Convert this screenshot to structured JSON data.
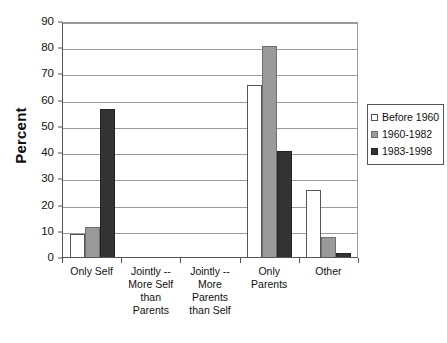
{
  "chart_data": {
    "type": "bar",
    "title": "",
    "xlabel": "",
    "ylabel": "Percent",
    "ylim": [
      0,
      90
    ],
    "ytick_step": 10,
    "yticks": [
      90,
      80,
      70,
      60,
      50,
      40,
      30,
      20,
      10,
      0
    ],
    "grid": true,
    "legend_position": "right",
    "categories": [
      "Only Self",
      "Jointly -- More Self than Parents",
      "Jointly -- More Parents than Self",
      "Only Parents",
      "Other"
    ],
    "category_label_lines": [
      [
        "Only Self"
      ],
      [
        "Jointly --",
        "More Self",
        "than",
        "Parents"
      ],
      [
        "Jointly --",
        "More",
        "Parents",
        "than Self"
      ],
      [
        "Only",
        "Parents"
      ],
      [
        "Other"
      ]
    ],
    "series": [
      {
        "name": "Before 1960",
        "color": "#ffffff",
        "values": [
          9,
          0,
          0,
          66,
          26
        ]
      },
      {
        "name": "1960-1982",
        "color": "#9a9a9a",
        "values": [
          12,
          0,
          0,
          81,
          8
        ]
      },
      {
        "name": "1983-1998",
        "color": "#333333",
        "values": [
          57,
          0,
          0,
          41,
          2
        ]
      }
    ]
  },
  "legend": {
    "items": [
      {
        "label": "Before 1960"
      },
      {
        "label": "1960-1982"
      },
      {
        "label": "1983-1998"
      }
    ]
  }
}
